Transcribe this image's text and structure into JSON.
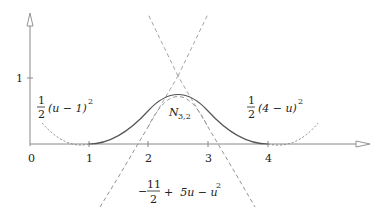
{
  "figure": {
    "axes": {
      "x_ticks": [
        {
          "label": "0",
          "value": 0
        },
        {
          "label": "1",
          "value": 1
        },
        {
          "label": "2",
          "value": 2
        },
        {
          "label": "3",
          "value": 3
        },
        {
          "label": "4",
          "value": 4
        }
      ],
      "y_ticks": [
        {
          "label": "1",
          "value": 1
        }
      ]
    },
    "labels": {
      "left_piece_frac_num": "1",
      "left_piece_frac_den": "2",
      "left_piece_expr": "(u − 1)",
      "left_piece_exp": "2",
      "center_name_main": "N",
      "center_name_sub": "3,2",
      "right_piece_frac_num": "1",
      "right_piece_frac_den": "2",
      "right_piece_expr": "(4 − u)",
      "right_piece_exp": "2",
      "middle_piece_sign": "−",
      "middle_piece_frac_num": "11",
      "middle_piece_frac_den": "2",
      "middle_piece_rest": "+  5u − u",
      "middle_piece_exp": "2"
    },
    "colors": {
      "axis": "#888888",
      "curve": "#555555",
      "dashed": "#888888",
      "text": "#222222"
    }
  }
}
